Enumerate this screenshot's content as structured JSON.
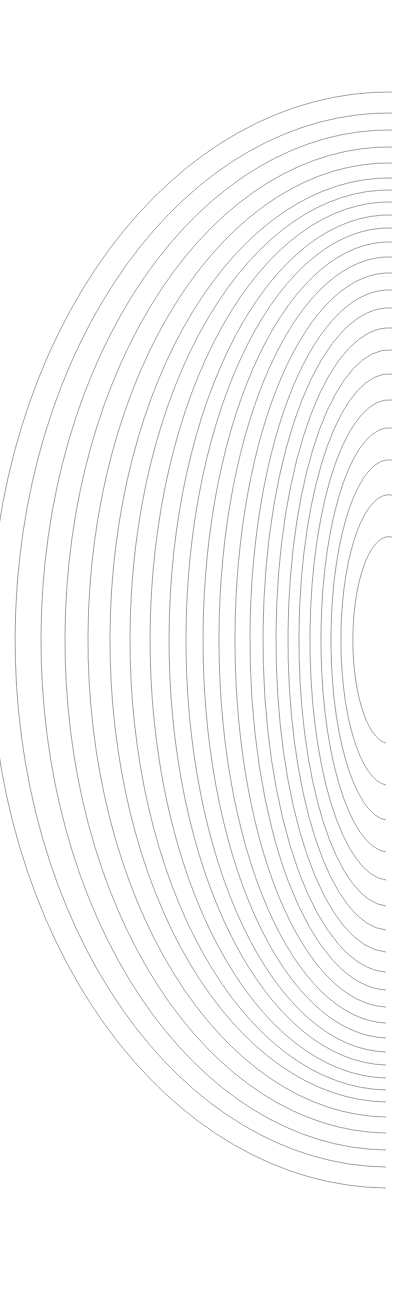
{
  "artwork": {
    "description": "Concentric half-ellipse line arcs opening to the right",
    "stroke_color": "#8a8a8a",
    "background": "#ffffff",
    "center": {
      "x": 396,
      "y": 640
    },
    "arcs": [
      {
        "rx": 399,
        "ry": 548
      },
      {
        "rx": 374,
        "ry": 527
      },
      {
        "rx": 348,
        "ry": 510
      },
      {
        "rx": 324,
        "ry": 493
      },
      {
        "rx": 301,
        "ry": 477
      },
      {
        "rx": 279,
        "ry": 462
      },
      {
        "rx": 259,
        "ry": 450
      },
      {
        "rx": 239,
        "ry": 438
      },
      {
        "rx": 220,
        "ry": 425
      },
      {
        "rx": 203,
        "ry": 412
      },
      {
        "rx": 186,
        "ry": 398
      },
      {
        "rx": 170,
        "ry": 383
      },
      {
        "rx": 154,
        "ry": 367
      },
      {
        "rx": 139,
        "ry": 350
      },
      {
        "rx": 126,
        "ry": 332
      },
      {
        "rx": 113,
        "ry": 312
      },
      {
        "rx": 101,
        "ry": 290
      },
      {
        "rx": 90,
        "ry": 266
      },
      {
        "rx": 79,
        "ry": 240
      },
      {
        "rx": 68,
        "ry": 212
      },
      {
        "rx": 58,
        "ry": 180
      },
      {
        "rx": 48,
        "ry": 145
      },
      {
        "rx": 36,
        "ry": 103
      }
    ]
  }
}
